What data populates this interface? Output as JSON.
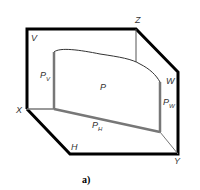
{
  "figure": {
    "caption": "a)",
    "colors": {
      "outline": "#000000",
      "inner": "#777777",
      "thin": "#555555",
      "label": "#333333"
    },
    "labels": {
      "V": "V",
      "Z": "Z",
      "W": "W",
      "X": "X",
      "Y": "Y",
      "H": "H",
      "P": "P",
      "PV_main": "P",
      "PV_sub": "V",
      "PW_main": "P",
      "PW_sub": "W",
      "PH_main": "P",
      "PH_sub": "H"
    }
  }
}
